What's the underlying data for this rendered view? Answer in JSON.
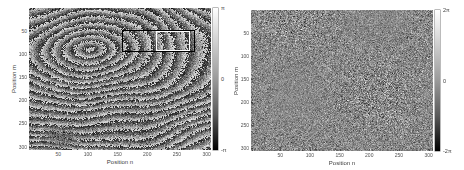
{
  "chart_data": [
    {
      "type": "heatmap",
      "title": "",
      "content": "wrapped interferometric phase (concentric elliptical fringes with noise)",
      "xlabel": "Position n",
      "ylabel": "Position m",
      "xticks": [
        50,
        100,
        150,
        200,
        250,
        300
      ],
      "yticks": [
        50,
        100,
        150,
        200,
        250,
        300
      ],
      "xlim": [
        0.5,
        307.5
      ],
      "ylim": [
        0.5,
        307.5
      ],
      "y_direction": "reversed",
      "grid": false,
      "legend": "none",
      "colormap": "gray",
      "fringe_center": [
        103,
        90
      ],
      "fringe_spacing": 22,
      "colorbar": {
        "range": [
          -3.1416,
          3.1416
        ],
        "ticks": [
          {
            "value": 3.1416,
            "label": "π"
          },
          {
            "value": 0,
            "label": "0"
          },
          {
            "value": -3.1416,
            "label": "-π"
          }
        ]
      },
      "annotations": [
        {
          "type": "rectangle",
          "color": "#000000",
          "x": [
            158,
            280
          ],
          "y": [
            48,
            96
          ]
        },
        {
          "type": "rectangle",
          "color": "#ffffff",
          "x": [
            215,
            272
          ],
          "y": [
            50,
            94
          ]
        }
      ]
    },
    {
      "type": "heatmap",
      "title": "",
      "content": "residual phase noise (approximately uniform around 0)",
      "xlabel": "Position n",
      "ylabel": "Position m",
      "xticks": [
        50,
        100,
        150,
        200,
        250,
        300
      ],
      "yticks": [
        50,
        100,
        150,
        200,
        250,
        300
      ],
      "xlim": [
        0.5,
        307.5
      ],
      "ylim": [
        0.5,
        307.5
      ],
      "y_direction": "reversed",
      "grid": false,
      "legend": "none",
      "colormap": "gray",
      "colorbar": {
        "range": [
          -6.2832,
          6.2832
        ],
        "ticks": [
          {
            "value": 6.2832,
            "label": "2π"
          },
          {
            "value": 0,
            "label": "0"
          },
          {
            "value": -6.2832,
            "label": "-2π"
          }
        ]
      },
      "annotations": []
    }
  ]
}
